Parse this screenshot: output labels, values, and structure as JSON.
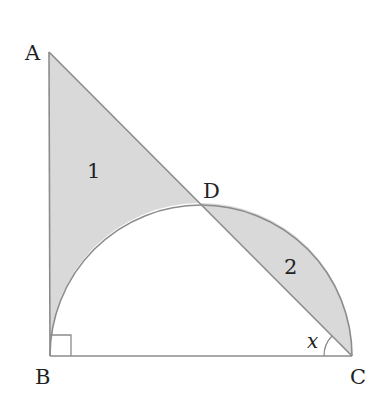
{
  "figure": {
    "vertices": {
      "A": {
        "label": "A"
      },
      "B": {
        "label": "B"
      },
      "C": {
        "label": "C"
      },
      "D": {
        "label": "D"
      }
    },
    "regions": [
      {
        "label": "1"
      },
      {
        "label": "2"
      }
    ],
    "angle_label": "x",
    "colors": {
      "shade": "#d9d9d9",
      "line": "#8c8c8c",
      "text": "#222222"
    }
  }
}
